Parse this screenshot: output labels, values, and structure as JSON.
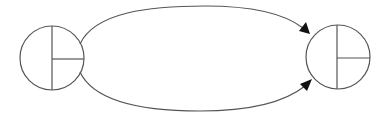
{
  "diagram": {
    "type": "state-transition",
    "colors": {
      "stroke": "#555555",
      "arrowhead": "#111111",
      "background": "#ffffff"
    },
    "nodes": [
      {
        "id": "left-node",
        "shape": "circle-divided-quadrant",
        "cx": 52,
        "cy": 58,
        "r": 32,
        "label": ""
      },
      {
        "id": "right-node",
        "shape": "circle-divided-quadrant",
        "cx": 338,
        "cy": 57,
        "r": 32,
        "label": ""
      }
    ],
    "edges": [
      {
        "id": "top-edge",
        "from": "left-node",
        "to": "right-node",
        "direction": "upper arc",
        "label": ""
      },
      {
        "id": "bottom-edge",
        "from": "left-node",
        "to": "right-node",
        "direction": "lower arc",
        "label": ""
      }
    ]
  }
}
